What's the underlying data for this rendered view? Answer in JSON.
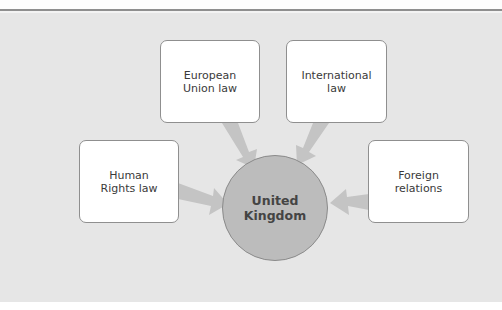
{
  "diagram": {
    "type": "hub-and-spoke",
    "center": {
      "label": "United\nKingdom",
      "fill": "#bcbcbc"
    },
    "nodes": [
      {
        "id": "eu",
        "label": "European\nUnion law"
      },
      {
        "id": "international",
        "label": "International\nlaw"
      },
      {
        "id": "human-rights",
        "label": "Human\nRights law"
      },
      {
        "id": "foreign",
        "label": "Foreign\nrelations"
      }
    ],
    "edges": [
      {
        "from": "eu",
        "to": "center"
      },
      {
        "from": "international",
        "to": "center"
      },
      {
        "from": "human-rights",
        "to": "center"
      },
      {
        "from": "foreign",
        "to": "center"
      }
    ],
    "colors": {
      "background": "#e6e6e6",
      "arrow": "#c4c4c4",
      "box": "#ffffff",
      "border": "#8f8f8f"
    }
  }
}
